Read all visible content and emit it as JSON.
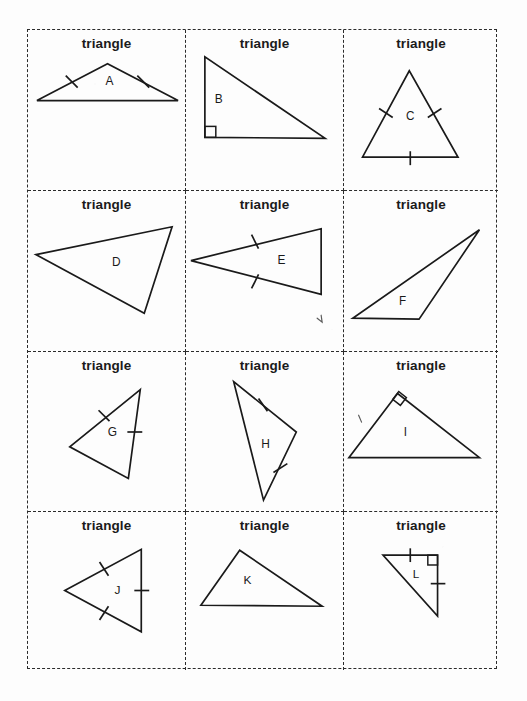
{
  "page": {
    "background_color": "#fdfdfd",
    "ink_color": "#1a1a1a",
    "border_style": "dashed",
    "grid": {
      "columns": 3,
      "rows": 4,
      "cell_count": 12
    }
  },
  "cards": [
    {
      "id": "card-a",
      "label": "triangle",
      "letter": "A",
      "shape": "isosceles acute triangle, apex up, wide base",
      "tick_marks": 2,
      "right_angle_marker": false,
      "vertices": [
        [
          80,
          34
        ],
        [
          9,
          71
        ],
        [
          151,
          71
        ]
      ],
      "ticks": [
        {
          "x1": 38,
          "y1": 46,
          "x2": 50,
          "y2": 58
        },
        {
          "x1": 110,
          "y1": 46,
          "x2": 122,
          "y2": 58
        }
      ],
      "letter_pos": [
        82,
        52
      ]
    },
    {
      "id": "card-b",
      "label": "triangle",
      "letter": "B",
      "shape": "right scalene triangle, right angle bottom-left",
      "tick_marks": 0,
      "right_angle_marker": true,
      "vertices": [
        [
          19,
          27
        ],
        [
          19,
          108
        ],
        [
          140,
          109
        ]
      ],
      "ticks": [],
      "right_angle": {
        "x": 19,
        "y": 97,
        "size": 11
      },
      "letter_pos": [
        33,
        70
      ]
    },
    {
      "id": "card-c",
      "label": "triangle",
      "letter": "C",
      "shape": "equilateral triangle, apex up",
      "tick_marks": 3,
      "right_angle_marker": false,
      "vertices": [
        [
          67,
          41
        ],
        [
          19,
          128
        ],
        [
          117,
          128
        ]
      ],
      "ticks": [
        {
          "x1": 36,
          "y1": 79,
          "x2": 50,
          "y2": 88
        },
        {
          "x1": 86,
          "y1": 88,
          "x2": 100,
          "y2": 79
        },
        {
          "x1": 68,
          "y1": 122,
          "x2": 68,
          "y2": 136
        }
      ],
      "letter_pos": [
        68,
        87
      ]
    },
    {
      "id": "card-d",
      "label": "triangle",
      "letter": "D",
      "shape": "scalene obtuse triangle, tilted",
      "tick_marks": 0,
      "right_angle_marker": false,
      "vertices": [
        [
          8,
          64
        ],
        [
          145,
          36
        ],
        [
          117,
          123
        ]
      ],
      "ticks": [],
      "letter_pos": [
        89,
        72
      ]
    },
    {
      "id": "card-e",
      "label": "triangle",
      "letter": "E",
      "shape": "isosceles triangle pointing left",
      "tick_marks": 2,
      "right_angle_marker": false,
      "vertices": [
        [
          5,
          70
        ],
        [
          136,
          38
        ],
        [
          136,
          104
        ]
      ],
      "ticks": [
        {
          "x1": 66,
          "y1": 44,
          "x2": 73,
          "y2": 58
        },
        {
          "x1": 66,
          "y1": 98,
          "x2": 73,
          "y2": 84
        }
      ],
      "letter_pos": [
        96,
        70
      ],
      "stray_mark": {
        "d": "M 132 128 l 5 4 l -1 -7"
      }
    },
    {
      "id": "card-f",
      "label": "triangle",
      "letter": "F",
      "shape": "thin obtuse scalene triangle",
      "tick_marks": 0,
      "right_angle_marker": false,
      "vertices": [
        [
          9,
          128
        ],
        [
          139,
          39
        ],
        [
          77,
          129
        ]
      ],
      "ticks": [],
      "letter_pos": [
        60,
        112
      ]
    },
    {
      "id": "card-g",
      "label": "triangle",
      "letter": "G",
      "shape": "rotated isosceles triangle",
      "tick_marks": 2,
      "right_angle_marker": false,
      "vertices": [
        [
          113,
          38
        ],
        [
          42,
          96
        ],
        [
          101,
          128
        ]
      ],
      "ticks": [
        {
          "x1": 71,
          "y1": 59,
          "x2": 82,
          "y2": 70
        },
        {
          "x1": 100,
          "y1": 81,
          "x2": 115,
          "y2": 81
        }
      ],
      "letter_pos": [
        85,
        82
      ]
    },
    {
      "id": "card-h",
      "label": "triangle",
      "letter": "H",
      "shape": "tall narrow scalene triangle",
      "tick_marks": 2,
      "right_angle_marker": false,
      "vertices": [
        [
          48,
          30
        ],
        [
          111,
          81
        ],
        [
          78,
          150
        ]
      ],
      "ticks": [
        {
          "x1": 73,
          "y1": 47,
          "x2": 82,
          "y2": 60
        },
        {
          "x1": 88,
          "y1": 122,
          "x2": 102,
          "y2": 113
        }
      ],
      "letter_pos": [
        80,
        94
      ]
    },
    {
      "id": "card-i",
      "label": "triangle",
      "letter": "I",
      "shape": "right triangle, right angle at apex",
      "tick_marks": 0,
      "right_angle_marker": true,
      "vertices": [
        [
          55,
          42
        ],
        [
          5,
          107
        ],
        [
          139,
          107
        ]
      ],
      "ticks": [],
      "right_angle_rot": {
        "cx": 57,
        "cy": 47,
        "size": 10,
        "angle": 38
      },
      "letter_pos": [
        63,
        82
      ],
      "stray_mark": {
        "d": "M 15 64 l 3 7"
      }
    },
    {
      "id": "card-j",
      "label": "triangle",
      "letter": "J",
      "shape": "equilateral triangle pointing left",
      "tick_marks": 3,
      "right_angle_marker": false,
      "vertices": [
        [
          37,
          80
        ],
        [
          114,
          38
        ],
        [
          114,
          122
        ]
      ],
      "ticks": [
        {
          "x1": 72,
          "y1": 51,
          "x2": 81,
          "y2": 65
        },
        {
          "x1": 72,
          "y1": 110,
          "x2": 81,
          "y2": 96
        },
        {
          "x1": 107,
          "y1": 80,
          "x2": 122,
          "y2": 80
        }
      ],
      "letter_pos": [
        90,
        80
      ]
    },
    {
      "id": "card-k",
      "label": "triangle",
      "letter": "K",
      "shape": "scalene obtuse triangle, apex left of center",
      "tick_marks": 0,
      "right_angle_marker": false,
      "vertices": [
        [
          54,
          39
        ],
        [
          15,
          95
        ],
        [
          137,
          96
        ]
      ],
      "ticks": [],
      "letter_pos": [
        62,
        70
      ]
    },
    {
      "id": "card-l",
      "label": "triangle",
      "letter": "L",
      "shape": "right isosceles triangle, right angle top-right",
      "tick_marks": 2,
      "right_angle_marker": true,
      "vertices": [
        [
          40,
          44
        ],
        [
          96,
          44
        ],
        [
          96,
          106
        ]
      ],
      "ticks": [
        {
          "x1": 68,
          "y1": 37,
          "x2": 68,
          "y2": 51
        },
        {
          "x1": 89,
          "y1": 73,
          "x2": 104,
          "y2": 73
        }
      ],
      "right_angle": {
        "x": 86,
        "y": 44,
        "size": 10
      },
      "letter_pos": [
        74,
        64
      ]
    }
  ]
}
